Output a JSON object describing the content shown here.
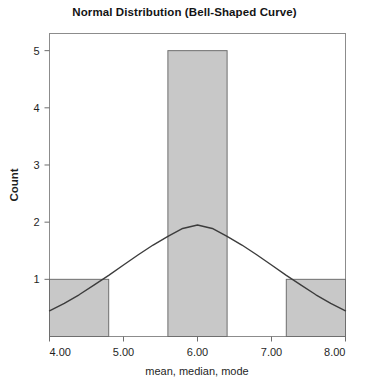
{
  "chart_data": {
    "type": "bar",
    "title": "Normal Distribution (Bell-Shaped Curve)",
    "xlabel": "mean, median, mode",
    "ylabel": "Count",
    "xlim": [
      4.0,
      8.0
    ],
    "ylim": [
      0,
      5.3
    ],
    "grid": false,
    "legend": null,
    "xticks": [
      4.0,
      5.0,
      6.0,
      7.0,
      8.0
    ],
    "xtick_labels": [
      "4.00",
      "5.00",
      "6.00",
      "7.00",
      "8.00"
    ],
    "yticks": [
      1,
      2,
      3,
      4,
      5
    ],
    "ytick_labels": [
      "1",
      "2",
      "3",
      "4",
      "5"
    ],
    "bars": [
      {
        "x_start": 4.0,
        "x_end": 4.8,
        "value": 1
      },
      {
        "x_start": 5.6,
        "x_end": 6.4,
        "value": 5
      },
      {
        "x_start": 7.2,
        "x_end": 8.0,
        "value": 1
      }
    ],
    "bar_fill": "#c8c8c8",
    "bar_edge": "#6e6e6e",
    "curve": {
      "name": "normal curve",
      "mean": 6.0,
      "peak_value": 1.95,
      "sigma": 1.05,
      "color": "#3c3c3c",
      "points": [
        {
          "x": 4.0,
          "y": 0.45
        },
        {
          "x": 4.2,
          "y": 0.58
        },
        {
          "x": 4.4,
          "y": 0.73
        },
        {
          "x": 4.6,
          "y": 0.9
        },
        {
          "x": 4.8,
          "y": 1.07
        },
        {
          "x": 5.0,
          "y": 1.25
        },
        {
          "x": 5.2,
          "y": 1.43
        },
        {
          "x": 5.4,
          "y": 1.6
        },
        {
          "x": 5.6,
          "y": 1.75
        },
        {
          "x": 5.8,
          "y": 1.89
        },
        {
          "x": 6.0,
          "y": 1.95
        },
        {
          "x": 6.2,
          "y": 1.89
        },
        {
          "x": 6.4,
          "y": 1.75
        },
        {
          "x": 6.6,
          "y": 1.6
        },
        {
          "x": 6.8,
          "y": 1.43
        },
        {
          "x": 7.0,
          "y": 1.25
        },
        {
          "x": 7.2,
          "y": 1.07
        },
        {
          "x": 7.4,
          "y": 0.9
        },
        {
          "x": 7.6,
          "y": 0.73
        },
        {
          "x": 7.8,
          "y": 0.58
        },
        {
          "x": 8.0,
          "y": 0.45
        }
      ]
    },
    "frame_color": "#8c8c8c",
    "background": "#ffffff"
  }
}
